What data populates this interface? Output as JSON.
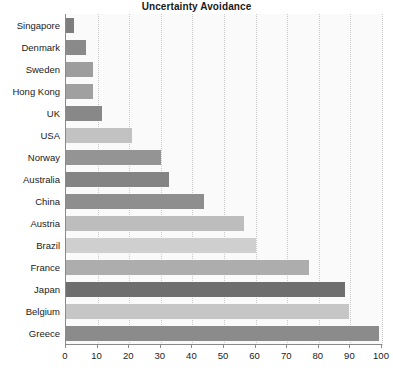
{
  "chart_data": {
    "type": "bar",
    "orientation": "horizontal",
    "title": "Uncertainty Avoidance",
    "xlabel": "",
    "ylabel": "",
    "xlim": [
      0,
      100
    ],
    "grid": true,
    "legend": false,
    "xticks": [
      0,
      10,
      20,
      30,
      40,
      50,
      60,
      70,
      80,
      90,
      100
    ],
    "categories": [
      "Singapore",
      "Denmark",
      "Sweden",
      "Hong Kong",
      "UK",
      "USA",
      "Norway",
      "Australia",
      "China",
      "Austria",
      "Brazil",
      "France",
      "Japan",
      "Belgium",
      "Greece"
    ],
    "values": [
      8,
      23,
      29,
      29,
      35,
      46,
      50,
      51,
      44,
      70,
      76,
      86,
      92,
      94,
      100
    ],
    "bars": [
      {
        "label": "Singapore",
        "value": 2.5,
        "color": "#7d7d7d"
      },
      {
        "label": "Denmark",
        "value": 6.3,
        "color": "#8a8a8a"
      },
      {
        "label": "Sweden",
        "value": 8.5,
        "color": "#9d9d9d"
      },
      {
        "label": "Hong Kong",
        "value": 8.5,
        "color": "#a0a0a0"
      },
      {
        "label": "UK",
        "value": 11.3,
        "color": "#888888"
      },
      {
        "label": "USA",
        "value": 21,
        "color": "#c2c2c2"
      },
      {
        "label": "Norway",
        "value": 30,
        "color": "#949494"
      },
      {
        "label": "Australia",
        "value": 32.6,
        "color": "#848484"
      },
      {
        "label": "China",
        "value": 43.6,
        "color": "#8e8e8e"
      },
      {
        "label": "Austria",
        "value": 56.2,
        "color": "#bdbdbd"
      },
      {
        "label": "Brazil",
        "value": 60,
        "color": "#cfcfcf"
      },
      {
        "label": "France",
        "value": 77,
        "color": "#adadad"
      },
      {
        "label": "Japan",
        "value": 88.4,
        "color": "#6e6e6e"
      },
      {
        "label": "Belgium",
        "value": 89.5,
        "color": "#c6c6c6"
      },
      {
        "label": "Greece",
        "value": 99,
        "color": "#8b8b8b"
      }
    ],
    "colors": {
      "background": "#ffffff",
      "plot_background": "#fafafa",
      "gridline": "#c8c8c8",
      "axis": "#8a8a8a",
      "text": "#1a1a1a"
    }
  }
}
